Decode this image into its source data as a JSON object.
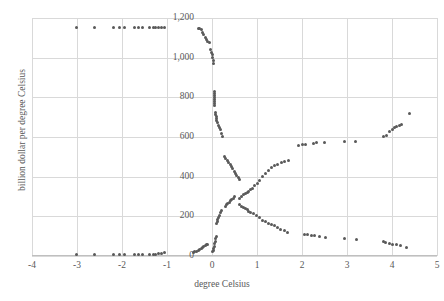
{
  "chart_data": {
    "type": "scatter",
    "title": "",
    "xlabel": "degree Celsius",
    "ylabel": "billion dollar per degree Celsius",
    "xlim": [
      -4,
      5
    ],
    "ylim": [
      0,
      1200
    ],
    "xticks": [
      -4,
      -3,
      -2,
      -1,
      0,
      1,
      2,
      3,
      4,
      5
    ],
    "xticklabels": [
      "-4",
      "-3",
      "-2",
      "-1",
      "0",
      "1",
      "2",
      "3",
      "4",
      "5"
    ],
    "yticks": [
      0,
      200,
      400,
      600,
      800,
      1000,
      1200
    ],
    "yticklabels": [
      "0",
      "200",
      "400",
      "600",
      "800",
      "1,000",
      "1,200"
    ],
    "grid": true,
    "legend": null,
    "marker": "square",
    "marker_color": "#595959",
    "grid_color": "#d9d9d9",
    "series": [
      {
        "name": "upper-branch",
        "points": [
          [
            -3.02,
            1150
          ],
          [
            -2.62,
            1150
          ],
          [
            -2.18,
            1150
          ],
          [
            -2.06,
            1150
          ],
          [
            -1.95,
            1150
          ],
          [
            -1.72,
            1150
          ],
          [
            -1.63,
            1150
          ],
          [
            -1.55,
            1150
          ],
          [
            -1.38,
            1150
          ],
          [
            -1.31,
            1150
          ],
          [
            -1.25,
            1150
          ],
          [
            -1.18,
            1150
          ],
          [
            -1.12,
            1150
          ],
          [
            -1.06,
            1150
          ],
          [
            -0.3,
            1148
          ],
          [
            -0.27,
            1146
          ],
          [
            -0.24,
            1140
          ],
          [
            -0.21,
            1128
          ],
          [
            -0.18,
            1115
          ],
          [
            -0.15,
            1102
          ],
          [
            -0.12,
            1092
          ],
          [
            -0.09,
            1084
          ],
          [
            -0.06,
            1078
          ],
          [
            -0.03,
            1040
          ],
          [
            -0.01,
            1028
          ],
          [
            0.01,
            1014
          ],
          [
            0.02,
            1000
          ],
          [
            0.03,
            986
          ],
          [
            0.04,
            970
          ],
          [
            0.05,
            828
          ],
          [
            0.05,
            818
          ],
          [
            0.05,
            808
          ],
          [
            0.05,
            798
          ],
          [
            0.05,
            790
          ],
          [
            0.05,
            780
          ],
          [
            0.06,
            768
          ],
          [
            0.06,
            758
          ],
          [
            0.07,
            726
          ],
          [
            0.08,
            714
          ],
          [
            0.09,
            704
          ],
          [
            0.1,
            694
          ],
          [
            0.11,
            684
          ],
          [
            0.13,
            672
          ],
          [
            0.15,
            660
          ],
          [
            0.17,
            648
          ],
          [
            0.19,
            636
          ],
          [
            0.21,
            620
          ],
          [
            0.23,
            604
          ],
          [
            0.28,
            500
          ],
          [
            0.31,
            490
          ],
          [
            0.34,
            480
          ],
          [
            0.37,
            470
          ],
          [
            0.4,
            460
          ],
          [
            0.43,
            450
          ],
          [
            0.46,
            440
          ],
          [
            0.49,
            428
          ],
          [
            0.52,
            418
          ],
          [
            0.55,
            406
          ],
          [
            0.58,
            396
          ],
          [
            0.6,
            386
          ],
          [
            0.5,
            300
          ],
          [
            0.47,
            292
          ],
          [
            0.44,
            284
          ],
          [
            0.41,
            278
          ],
          [
            0.38,
            272
          ],
          [
            0.35,
            266
          ],
          [
            0.32,
            260
          ],
          [
            0.29,
            252
          ],
          [
            0.2,
            230
          ],
          [
            0.18,
            218
          ],
          [
            0.16,
            206
          ],
          [
            0.14,
            196
          ],
          [
            0.13,
            186
          ],
          [
            0.12,
            176
          ],
          [
            0.11,
            164
          ],
          [
            0.09,
            96
          ],
          [
            0.08,
            86
          ],
          [
            0.07,
            74
          ],
          [
            0.06,
            62
          ],
          [
            0.05,
            50
          ],
          [
            0.04,
            40
          ],
          [
            0.03,
            30
          ],
          [
            0.02,
            22
          ]
        ]
      },
      {
        "name": "lower-branch",
        "points": [
          [
            -3.02,
            6
          ],
          [
            -2.62,
            6
          ],
          [
            -2.18,
            6
          ],
          [
            -2.06,
            6
          ],
          [
            -1.95,
            6
          ],
          [
            -1.72,
            8
          ],
          [
            -1.63,
            8
          ],
          [
            -1.55,
            8
          ],
          [
            -1.38,
            10
          ],
          [
            -1.31,
            10
          ],
          [
            -1.25,
            10
          ],
          [
            -1.18,
            12
          ],
          [
            -1.12,
            14
          ],
          [
            -1.06,
            16
          ],
          [
            -0.42,
            20
          ],
          [
            -0.38,
            22
          ],
          [
            -0.34,
            24
          ],
          [
            -0.3,
            28
          ],
          [
            -0.27,
            32
          ],
          [
            -0.24,
            38
          ],
          [
            -0.21,
            44
          ],
          [
            -0.18,
            48
          ],
          [
            -0.15,
            52
          ],
          [
            -0.12,
            56
          ],
          [
            -0.09,
            60
          ],
          [
            0.62,
            290
          ],
          [
            0.66,
            300
          ],
          [
            0.7,
            308
          ],
          [
            0.74,
            314
          ],
          [
            0.78,
            320
          ],
          [
            0.82,
            326
          ],
          [
            0.86,
            334
          ],
          [
            0.9,
            342
          ],
          [
            0.95,
            354
          ],
          [
            1.0,
            368
          ],
          [
            1.05,
            382
          ],
          [
            1.12,
            400
          ],
          [
            1.18,
            414
          ],
          [
            1.25,
            432
          ],
          [
            1.32,
            448
          ],
          [
            1.38,
            456
          ],
          [
            1.45,
            462
          ],
          [
            1.55,
            470
          ],
          [
            1.62,
            476
          ],
          [
            1.7,
            484
          ],
          [
            1.92,
            556
          ],
          [
            2.02,
            560
          ],
          [
            2.08,
            562
          ],
          [
            2.25,
            568
          ],
          [
            2.32,
            570
          ],
          [
            2.5,
            572
          ],
          [
            2.95,
            578
          ],
          [
            3.18,
            578
          ],
          [
            3.82,
            604
          ],
          [
            3.88,
            610
          ],
          [
            3.95,
            626
          ],
          [
            4.0,
            640
          ],
          [
            4.05,
            648
          ],
          [
            4.1,
            652
          ],
          [
            4.16,
            658
          ],
          [
            4.22,
            662
          ],
          [
            4.38,
            720
          ]
        ]
      },
      {
        "name": "descending-branch",
        "points": [
          [
            0.62,
            262
          ],
          [
            0.66,
            252
          ],
          [
            0.7,
            244
          ],
          [
            0.74,
            238
          ],
          [
            0.78,
            232
          ],
          [
            0.82,
            226
          ],
          [
            0.86,
            220
          ],
          [
            0.92,
            212
          ],
          [
            0.98,
            202
          ],
          [
            1.05,
            192
          ],
          [
            1.12,
            180
          ],
          [
            1.18,
            172
          ],
          [
            1.25,
            166
          ],
          [
            1.32,
            160
          ],
          [
            1.38,
            152
          ],
          [
            1.45,
            144
          ],
          [
            1.52,
            136
          ],
          [
            1.6,
            128
          ],
          [
            1.68,
            120
          ],
          [
            2.05,
            106
          ],
          [
            2.12,
            106
          ],
          [
            2.22,
            102
          ],
          [
            2.28,
            102
          ],
          [
            2.38,
            96
          ],
          [
            2.52,
            94
          ],
          [
            2.95,
            86
          ],
          [
            3.2,
            84
          ],
          [
            3.82,
            74
          ],
          [
            3.86,
            68
          ],
          [
            3.95,
            62
          ],
          [
            4.02,
            58
          ],
          [
            4.1,
            56
          ],
          [
            4.18,
            52
          ],
          [
            4.32,
            44
          ]
        ]
      }
    ]
  }
}
